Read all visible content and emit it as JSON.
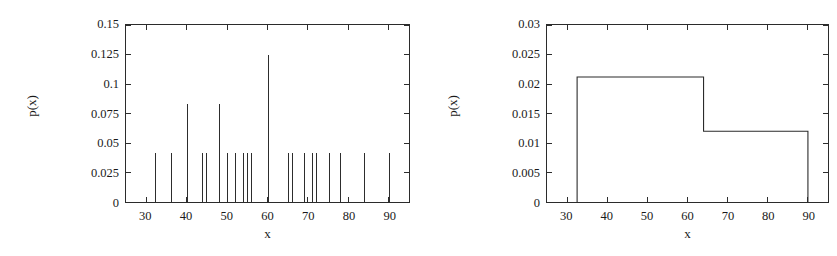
{
  "figure": {
    "background": "#ffffff",
    "ink": "#2b2b2b"
  },
  "panels": [
    {
      "id": "left",
      "xlabel": "x",
      "ylabel": "p(x)",
      "ytick_labels": [
        "0",
        "0.025",
        "0.05",
        "0.075",
        "0.1",
        "0.125",
        "0.15"
      ],
      "xtick_labels": [
        "30",
        "40",
        "50",
        "60",
        "70",
        "80",
        "90"
      ]
    },
    {
      "id": "right",
      "xlabel": "x",
      "ylabel": "p(x)",
      "ytick_labels": [
        "0",
        "0.005",
        "0.01",
        "0.015",
        "0.02",
        "0.025",
        "0.03"
      ],
      "xtick_labels": [
        "30",
        "40",
        "50",
        "60",
        "70",
        "80",
        "90"
      ]
    }
  ],
  "chart_data": [
    {
      "type": "bar",
      "subtype": "impulses",
      "title": "",
      "xlabel": "x",
      "ylabel": "p(x)",
      "xlim": [
        25,
        95
      ],
      "ylim": [
        0,
        0.15
      ],
      "xticks": [
        30,
        40,
        50,
        60,
        70,
        80,
        90
      ],
      "yticks": [
        0,
        0.025,
        0.05,
        0.075,
        0.1,
        0.125,
        0.15
      ],
      "grid": false,
      "legend": null,
      "x": [
        32,
        36,
        40,
        44,
        45,
        48,
        50,
        52,
        54,
        55,
        56,
        60,
        65,
        66,
        69,
        71,
        72,
        75,
        78,
        84,
        90
      ],
      "values": [
        0.0417,
        0.0417,
        0.0833,
        0.0417,
        0.0417,
        0.0833,
        0.0417,
        0.0417,
        0.0417,
        0.0417,
        0.0417,
        0.125,
        0.0417,
        0.0417,
        0.0417,
        0.0417,
        0.0417,
        0.0417,
        0.0417,
        0.0417,
        0.0417
      ]
    },
    {
      "type": "bar",
      "subtype": "histogram",
      "title": "",
      "xlabel": "x",
      "ylabel": "p(x)",
      "xlim": [
        25,
        95
      ],
      "ylim": [
        0,
        0.03
      ],
      "xticks": [
        30,
        40,
        50,
        60,
        70,
        80,
        90
      ],
      "yticks": [
        0,
        0.005,
        0.01,
        0.015,
        0.02,
        0.025,
        0.03
      ],
      "grid": false,
      "legend": null,
      "bin_edges": [
        32.5,
        64,
        90
      ],
      "values": [
        0.0212,
        0.012
      ]
    }
  ]
}
